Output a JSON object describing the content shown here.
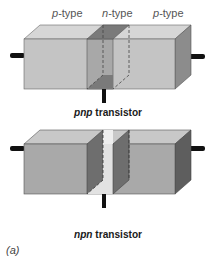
{
  "panel_label": "(a)",
  "top_cropped_text": "",
  "transistors": [
    {
      "name": "pnp",
      "caption_prefix": "pnp",
      "caption_suffix": " transistor",
      "regions": [
        {
          "letter": "p",
          "suffix": "-type"
        },
        {
          "letter": "n",
          "suffix": "-type"
        },
        {
          "letter": "p",
          "suffix": "-type"
        }
      ],
      "colors": {
        "outer_front": "#c4c4c4",
        "outer_top": "#d6d6d6",
        "outer_side": "#8c8c8c",
        "middle_front": "#a8a8a8",
        "middle_top": "#7a7a7a",
        "middle_back": "#8a8a8a"
      }
    },
    {
      "name": "npn",
      "caption_prefix": "npn",
      "caption_suffix": " transistor",
      "regions": [
        {
          "letter": "n",
          "suffix": "-type"
        },
        {
          "letter": "p",
          "suffix": "-type"
        },
        {
          "letter": "n",
          "suffix": "-type"
        }
      ],
      "colors": {
        "outer_front": "#a9a9a9",
        "outer_top": "#c8c8c8",
        "outer_side": "#5e5e5e",
        "middle_front": "#e2e2e2",
        "middle_top": "#eeeeee",
        "middle_back": "#6e6e6e"
      }
    }
  ]
}
